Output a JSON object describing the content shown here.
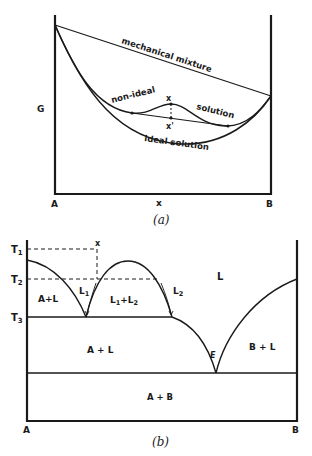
{
  "panel_a": {
    "caption": "(a)",
    "y_axis_label": "G",
    "left_label": "A",
    "right_label": "B",
    "x_mark_label": "x",
    "curves": {
      "mechanical": "mechanical mixture",
      "non_ideal_1": "non-ideal",
      "non_ideal_2": "solution",
      "ideal": "ideal solution"
    },
    "points": {
      "upper": "x",
      "lower": "x'"
    }
  },
  "panel_b": {
    "caption": "(b)",
    "left_label": "A",
    "right_label": "B",
    "temps": {
      "t1": "T1",
      "t2": "T2",
      "t3": "T3"
    },
    "composition_mark": "x",
    "regions": {
      "liquid": "L",
      "a_plus_l_upper": "A+L",
      "l1_plus_l2": "L1+L2",
      "a_plus_l_lower": "A + L",
      "b_plus_l": "B + L",
      "a_plus_b": "A + B"
    },
    "liquids": {
      "l1": "L1",
      "l2": "L2"
    },
    "eutectic": "E"
  },
  "colors": {
    "ink": "#1a1a1a",
    "paper": "#ffffff"
  }
}
